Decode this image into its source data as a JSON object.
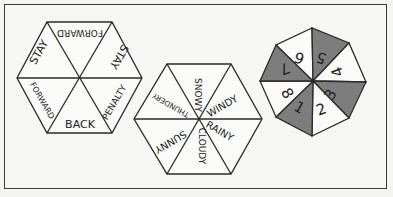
{
  "spinners": [
    {
      "name": "movement-spinner",
      "shape": "hexagon",
      "sections": [
        "FORWARD",
        "STAY",
        "PENALTY",
        "BACK",
        "FORWARD",
        "STAY"
      ]
    },
    {
      "name": "weather-spinner",
      "shape": "hexagon",
      "sections": [
        "SNOWY",
        "WINDY",
        "RAINY",
        "CLOUDY",
        "SUNNY",
        "THUNDERY"
      ]
    },
    {
      "name": "number-spinner",
      "shape": "octagon",
      "sections": [
        "5",
        "4",
        "3",
        "2",
        "1",
        "8",
        "7",
        "6"
      ],
      "shaded_sections": [
        "5",
        "3",
        "1",
        "7"
      ]
    }
  ],
  "colors": {
    "line": "#2a2a2a",
    "shade": "#7d7d7d",
    "paper": "#f6f6f4"
  }
}
